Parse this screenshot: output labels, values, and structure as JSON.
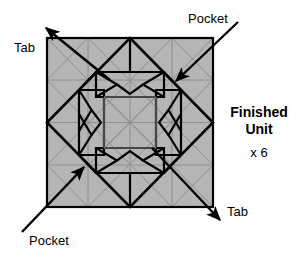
{
  "figure": {
    "type": "origami-quilt-block-assembly-diagram"
  },
  "colors": {
    "paper_fill": "#b5b5b5",
    "outline": "#000000",
    "fold_line": "#8a8a8a",
    "background": "#ffffff",
    "text": "#000000"
  },
  "labels": {
    "tab_top_left": "Tab",
    "pocket_top_right": "Pocket",
    "pocket_bottom_left": "Pocket",
    "tab_bottom_right": "Tab",
    "finished_line1": "Finished",
    "finished_line2": "Unit",
    "quantity": "x 6"
  },
  "callouts": [
    {
      "id": "tab-top-left",
      "label": "Tab",
      "direction": "up-left",
      "arrow_from": [
        110,
        80
      ],
      "arrow_to": [
        44,
        26
      ],
      "label_x": 14,
      "label_y": 50
    },
    {
      "id": "pocket-top-right",
      "label": "Pocket",
      "direction": "down-left",
      "arrow_from": [
        238,
        22
      ],
      "arrow_to": [
        174,
        82
      ],
      "label_x": 188,
      "label_y": 22
    },
    {
      "id": "pocket-bottom-left",
      "label": "Pocket",
      "direction": "up-right",
      "arrow_from": [
        22,
        232
      ],
      "arrow_to": [
        86,
        166
      ],
      "label_x": 29,
      "label_y": 242
    },
    {
      "id": "tab-bottom-right",
      "label": "Tab",
      "direction": "down-right",
      "arrow_from": [
        152,
        148
      ],
      "arrow_to": [
        222,
        222
      ],
      "label_x": 226,
      "label_y": 214
    }
  ],
  "geometry": {
    "square": {
      "x": 47,
      "y": 38,
      "width": 166,
      "height": 169
    },
    "center": [
      130,
      122.5
    ],
    "description": "Square paper unit with inscribed diamond, four folded flaps with notched chevron ends arranged around a central square, plus faint interior fold lines."
  }
}
